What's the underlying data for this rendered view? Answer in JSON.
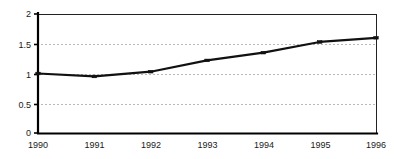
{
  "chart_data": {
    "type": "line",
    "title": "",
    "xlabel": "",
    "ylabel": "",
    "categories": [
      "1990",
      "1991",
      "1992",
      "1993",
      "1994",
      "1995",
      "1996"
    ],
    "x": [
      1990,
      1991,
      1992,
      1993,
      1994,
      1995,
      1996
    ],
    "values": [
      1.0,
      0.95,
      1.03,
      1.22,
      1.35,
      1.53,
      1.6
    ],
    "series": [
      {
        "name": "",
        "values": [
          1.0,
          0.95,
          1.03,
          1.22,
          1.35,
          1.53,
          1.6
        ]
      }
    ],
    "ylim": [
      0,
      2
    ],
    "xlim": [
      1990,
      1996
    ],
    "y_ticks": [
      0,
      0.5,
      1,
      1.5,
      2
    ],
    "y_tick_labels": [
      "0",
      "0.5",
      "1",
      "1.5",
      "2"
    ],
    "x_ticks": [
      1990,
      1991,
      1992,
      1993,
      1994,
      1995,
      1996
    ],
    "x_tick_labels": [
      "1990",
      "1991",
      "1992",
      "1993",
      "1994",
      "1995",
      "1996"
    ],
    "grid": "horizontal-dashed",
    "legend": "none",
    "line_color": "#111111",
    "grid_color": "#9a9a9a",
    "axis_color": "#000000",
    "background_color": "#ffffff",
    "marker": "square"
  },
  "axis": {
    "y_labels": [
      "2",
      "1.5",
      "1",
      "0.5",
      "0"
    ],
    "x_labels": [
      "1990",
      "1991",
      "1992",
      "1993",
      "1994",
      "1995",
      "1996"
    ]
  }
}
